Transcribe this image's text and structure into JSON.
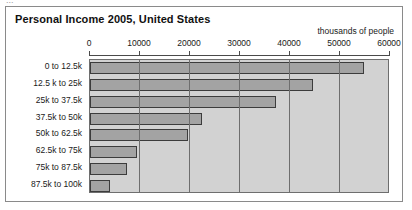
{
  "clipped_header_fragment": "...",
  "chart_data": {
    "type": "bar",
    "orientation": "horizontal",
    "title": "Personal Income 2005, United States",
    "xlabel": "thousands of people",
    "ylabel": "",
    "xlim": [
      0,
      60000
    ],
    "xticks": [
      0,
      10000,
      20000,
      30000,
      40000,
      50000,
      60000
    ],
    "xtick_labels": [
      "0",
      "10000",
      "20000",
      "30000",
      "40000",
      "50000",
      "60000"
    ],
    "grid": true,
    "legend": false,
    "categories": [
      "0 to 12.5k",
      "12.5 k to 25k",
      "25k to 37.5k",
      "37.5k to 50k",
      "50k to 62.5k",
      "62.5k to 75k",
      "75k to 87.5k",
      "87.5k to 100k"
    ],
    "values": [
      54800,
      44600,
      37200,
      22400,
      19600,
      9400,
      7400,
      4000
    ],
    "bar_color": "#a3a3a3",
    "bar_edge_color": "#3c3c3c",
    "plot_background": "#d2d2d2",
    "panel_background": "#ffffff"
  }
}
